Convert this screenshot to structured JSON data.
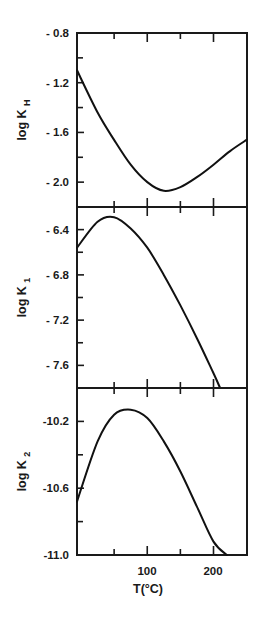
{
  "chart_data": [
    {
      "type": "line",
      "panel": "top",
      "title": "",
      "xlabel": "T(°C)",
      "ylabel": "log K_H",
      "ylabel_main": "log K",
      "ylabel_sub": "H",
      "xlim": [
        0,
        250
      ],
      "ylim": [
        -2.2,
        -0.8
      ],
      "yticks": [
        -0.8,
        -1.2,
        -1.6,
        -2.0
      ],
      "ytick_labels": [
        "- 0.8",
        "- 1.2",
        "- 1.6",
        "- 2.0"
      ],
      "yminor": [
        -1.0,
        -1.4,
        -1.8
      ],
      "xticks_minor": [
        50,
        150
      ],
      "xticks_major": [
        100,
        200
      ],
      "grid": false,
      "series": [
        {
          "name": "log K_H",
          "x": [
            0,
            25,
            50,
            75,
            100,
            125,
            150,
            175,
            200,
            225,
            250
          ],
          "values": [
            -1.1,
            -1.44,
            -1.66,
            -1.86,
            -2.0,
            -2.07,
            -2.04,
            -1.96,
            -1.86,
            -1.75,
            -1.66
          ]
        }
      ]
    },
    {
      "type": "line",
      "panel": "middle",
      "title": "",
      "xlabel": "T(°C)",
      "ylabel": "log K_1",
      "ylabel_main": "log K",
      "ylabel_sub": "1",
      "xlim": [
        0,
        250
      ],
      "ylim": [
        -7.8,
        -6.2
      ],
      "yticks": [
        -6.4,
        -6.8,
        -7.2,
        -7.6
      ],
      "ytick_labels": [
        "- 6.4",
        "- 6.8",
        "- 7.2",
        "- 7.6"
      ],
      "yminor": [
        -6.6,
        -7.0,
        -7.4
      ],
      "xticks_minor": [
        50,
        150
      ],
      "xticks_major": [
        100,
        200
      ],
      "grid": false,
      "series": [
        {
          "name": "log K_1",
          "x": [
            0,
            25,
            50,
            75,
            100,
            125,
            150,
            175,
            200,
            210
          ],
          "values": [
            -6.56,
            -6.33,
            -6.29,
            -6.39,
            -6.56,
            -6.8,
            -7.07,
            -7.36,
            -7.67,
            -7.8
          ]
        }
      ]
    },
    {
      "type": "line",
      "panel": "bottom",
      "title": "",
      "xlabel": "T(°C)",
      "ylabel": "log K_2",
      "ylabel_main": "log K",
      "ylabel_sub": "2",
      "xlim": [
        0,
        250
      ],
      "ylim": [
        -11.0,
        -10.0
      ],
      "yticks": [
        -10.2,
        -10.6,
        -11.0
      ],
      "ytick_labels": [
        "-10.2",
        "-10.6",
        "-11.0"
      ],
      "yminor": [
        -10.4,
        -10.8
      ],
      "xticks_minor": [
        50,
        150
      ],
      "xticks_major": [
        100,
        200
      ],
      "xtick_labels": [
        "100",
        "200"
      ],
      "grid": false,
      "series": [
        {
          "name": "log K_2",
          "x": [
            0,
            25,
            50,
            75,
            100,
            125,
            150,
            175,
            200,
            220
          ],
          "values": [
            -10.68,
            -10.32,
            -10.16,
            -10.13,
            -10.18,
            -10.32,
            -10.5,
            -10.71,
            -10.92,
            -11.0
          ]
        }
      ]
    }
  ],
  "xaxis": {
    "label": "T(°C)",
    "tick_labels": [
      "100",
      "200"
    ]
  }
}
